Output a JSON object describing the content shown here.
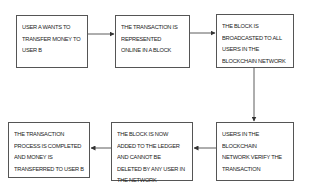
{
  "diagram": {
    "type": "flowchart",
    "direction": "clockwise-loop",
    "colors": {
      "border": "#555555",
      "text": "#222222",
      "arrow": "#333333",
      "background": "#ffffff"
    },
    "steps": [
      {
        "id": 1,
        "label": "USER A WANTS TO\nTRANSFER MONEY TO\nUSER B"
      },
      {
        "id": 2,
        "label": "THE TRANSACTION IS\nREPRESENTED\nONLINE IN A BLOCK"
      },
      {
        "id": 3,
        "label": "THE BLOCK IS\nBROADCASTED TO ALL\nUSERS IN THE\nBLOCKCHAIN NETWORK"
      },
      {
        "id": 4,
        "label": "USERS IN THE BLOCKCHAIN\nNETWORK VERIFY THE\nTRANSACTION"
      },
      {
        "id": 5,
        "label": "THE BLOCK IS NOW\nADDED TO THE LEDGER\nAND CANNOT BE\nDELETED BY ANY USER IN\nTHE NETWORK"
      },
      {
        "id": 6,
        "label": "THE TRANSACTION\nPROCESS IS COMPLETED\nAND MONEY IS\nTRANSFERRED TO USER B"
      }
    ],
    "edges": [
      {
        "from": 1,
        "to": 2
      },
      {
        "from": 2,
        "to": 3
      },
      {
        "from": 3,
        "to": 4
      },
      {
        "from": 4,
        "to": 5
      },
      {
        "from": 5,
        "to": 6
      }
    ]
  }
}
